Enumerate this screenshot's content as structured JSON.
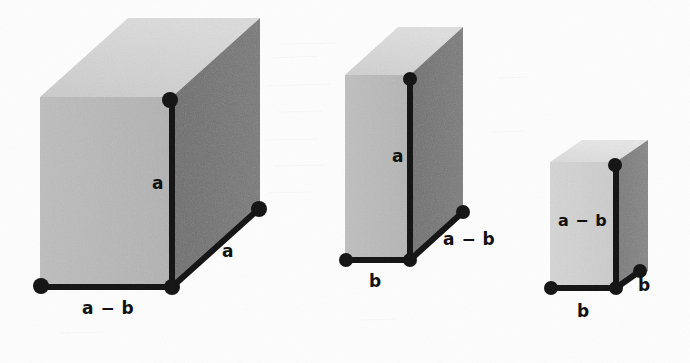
{
  "figure": {
    "background_color": "#fdfdfd",
    "palette": {
      "front_face": "#b9b9b9",
      "top_face": "#d2d2d2",
      "side_face": "#6e6e6e",
      "edge": "#121212",
      "label": "#111111"
    },
    "boxes": [
      {
        "id": "box-1",
        "name": "large-box",
        "front": {
          "x": 40,
          "y": 97,
          "w": 132,
          "h": 190
        },
        "depth": {
          "dx": 88,
          "dy": -79
        },
        "labels": {
          "height": "a",
          "width": "a − b",
          "depth": "a"
        }
      },
      {
        "id": "box-2",
        "name": "medium-box",
        "front": {
          "x": 345,
          "y": 75,
          "w": 65,
          "h": 185
        },
        "depth": {
          "dx": 53,
          "dy": -48
        },
        "labels": {
          "height": "a",
          "width": "b",
          "depth": "a − b"
        }
      },
      {
        "id": "box-3",
        "name": "small-box",
        "front": {
          "x": 550,
          "y": 162,
          "w": 66,
          "h": 126
        },
        "depth": {
          "dx": 32,
          "dy": -22
        },
        "labels": {
          "height": "a − b",
          "width": "b",
          "depth": "b"
        }
      }
    ],
    "label_positions": {
      "box1_height": {
        "x": 152,
        "y": 175
      },
      "box1_width": {
        "x": 82,
        "y": 300
      },
      "box1_depth": {
        "x": 222,
        "y": 243
      },
      "box2_height": {
        "x": 392,
        "y": 148
      },
      "box2_width": {
        "x": 369,
        "y": 273
      },
      "box2_depth": {
        "x": 443,
        "y": 231
      },
      "box3_height": {
        "x": 558,
        "y": 213
      },
      "box3_width": {
        "x": 577,
        "y": 303
      },
      "box3_depth": {
        "x": 638,
        "y": 277
      }
    }
  }
}
